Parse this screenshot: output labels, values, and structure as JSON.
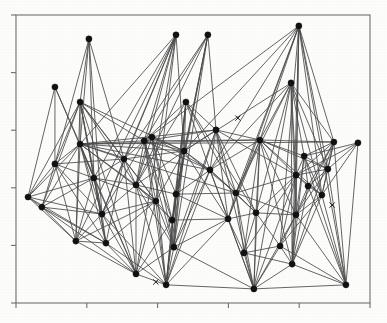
{
  "figure": {
    "title": "",
    "background_color": "#fdfdfc",
    "frame_color": "#6f6f6f",
    "node_color": "#121212",
    "edge_color": "#4a4a4a",
    "marker_color": "#1a1a1a"
  },
  "axes": {
    "x_tick_count": 6,
    "y_tick_count": 6,
    "x_tick_labels": [
      "",
      "",
      "",
      "",
      "",
      ""
    ],
    "y_tick_labels": [
      "",
      "",
      "",
      "",
      "",
      ""
    ],
    "xlabel": "",
    "ylabel": "",
    "grid": "off"
  },
  "chart_data": {
    "type": "scatter",
    "title": "",
    "subtitle": "",
    "xlabel": "",
    "ylabel": "",
    "xlim": [
      0,
      100
    ],
    "ylim": [
      0,
      100
    ],
    "grid": false,
    "legend": "none",
    "x_ticks": [
      0,
      20,
      40,
      60,
      80,
      100
    ],
    "y_ticks": [
      0,
      20,
      40,
      60,
      80,
      100
    ],
    "node_count": 46,
    "edge_count": 160,
    "marker_count": 3,
    "nodes": [
      {
        "id": 0,
        "x": 20.6,
        "y": 91.7
      },
      {
        "id": 1,
        "x": 45.2,
        "y": 93.1
      },
      {
        "id": 2,
        "x": 54.2,
        "y": 93.1
      },
      {
        "id": 3,
        "x": 79.9,
        "y": 96.2
      },
      {
        "id": 4,
        "x": 11.0,
        "y": 75.0
      },
      {
        "id": 5,
        "x": 18.1,
        "y": 69.8
      },
      {
        "id": 6,
        "x": 48.0,
        "y": 69.8
      },
      {
        "id": 7,
        "x": 77.7,
        "y": 76.4
      },
      {
        "id": 8,
        "x": 18.1,
        "y": 55.2
      },
      {
        "id": 9,
        "x": 36.2,
        "y": 56.3
      },
      {
        "id": 10,
        "x": 38.4,
        "y": 57.6
      },
      {
        "id": 11,
        "x": 56.5,
        "y": 60.1
      },
      {
        "id": 12,
        "x": 68.9,
        "y": 56.6
      },
      {
        "id": 13,
        "x": 89.8,
        "y": 55.9
      },
      {
        "id": 14,
        "x": 96.6,
        "y": 55.6
      },
      {
        "id": 15,
        "x": 11.0,
        "y": 48.3
      },
      {
        "id": 16,
        "x": 30.5,
        "y": 50.0
      },
      {
        "id": 17,
        "x": 47.5,
        "y": 52.8
      },
      {
        "id": 18,
        "x": 81.4,
        "y": 51.0
      },
      {
        "id": 19,
        "x": 88.1,
        "y": 46.5
      },
      {
        "id": 20,
        "x": 3.4,
        "y": 36.8
      },
      {
        "id": 21,
        "x": 7.3,
        "y": 33.3
      },
      {
        "id": 22,
        "x": 22.0,
        "y": 43.4
      },
      {
        "id": 23,
        "x": 33.9,
        "y": 41.0
      },
      {
        "id": 24,
        "x": 54.8,
        "y": 46.2
      },
      {
        "id": 25,
        "x": 79.1,
        "y": 44.4
      },
      {
        "id": 26,
        "x": 82.5,
        "y": 40.6
      },
      {
        "id": 27,
        "x": 39.5,
        "y": 35.4
      },
      {
        "id": 28,
        "x": 45.2,
        "y": 37.8
      },
      {
        "id": 29,
        "x": 62.1,
        "y": 38.2
      },
      {
        "id": 30,
        "x": 86.4,
        "y": 37.5
      },
      {
        "id": 31,
        "x": 24.3,
        "y": 30.9
      },
      {
        "id": 32,
        "x": 44.1,
        "y": 28.8
      },
      {
        "id": 33,
        "x": 59.9,
        "y": 29.2
      },
      {
        "id": 34,
        "x": 67.8,
        "y": 31.3
      },
      {
        "id": 35,
        "x": 79.1,
        "y": 30.6
      },
      {
        "id": 36,
        "x": 16.9,
        "y": 21.5
      },
      {
        "id": 37,
        "x": 25.4,
        "y": 20.8
      },
      {
        "id": 38,
        "x": 44.6,
        "y": 19.4
      },
      {
        "id": 39,
        "x": 64.4,
        "y": 17.4
      },
      {
        "id": 40,
        "x": 74.6,
        "y": 19.8
      },
      {
        "id": 41,
        "x": 78.0,
        "y": 13.5
      },
      {
        "id": 42,
        "x": 33.9,
        "y": 10.1
      },
      {
        "id": 43,
        "x": 42.4,
        "y": 6.3
      },
      {
        "id": 44,
        "x": 67.2,
        "y": 4.9
      },
      {
        "id": 45,
        "x": 93.2,
        "y": 6.3
      }
    ],
    "markers": [
      {
        "id": "m0",
        "x": 62.7,
        "y": 64.2,
        "shape": "x"
      },
      {
        "id": "m1",
        "x": 89.3,
        "y": 34.0,
        "shape": "x"
      },
      {
        "id": "m2",
        "x": 39.5,
        "y": 7.3,
        "shape": "x"
      }
    ],
    "edges": [
      [
        0,
        5
      ],
      [
        0,
        8
      ],
      [
        0,
        15
      ],
      [
        0,
        22
      ],
      [
        0,
        16
      ],
      [
        0,
        31
      ],
      [
        1,
        8
      ],
      [
        1,
        16
      ],
      [
        1,
        22
      ],
      [
        1,
        27
      ],
      [
        1,
        36
      ],
      [
        1,
        31
      ],
      [
        1,
        9
      ],
      [
        1,
        23
      ],
      [
        1,
        42
      ],
      [
        1,
        17
      ],
      [
        2,
        9
      ],
      [
        2,
        16
      ],
      [
        2,
        23
      ],
      [
        2,
        28
      ],
      [
        2,
        32
      ],
      [
        2,
        38
      ],
      [
        2,
        11
      ],
      [
        2,
        17
      ],
      [
        3,
        9
      ],
      [
        3,
        12
      ],
      [
        3,
        17
      ],
      [
        3,
        24
      ],
      [
        3,
        29
      ],
      [
        3,
        33
      ],
      [
        3,
        13
      ],
      [
        3,
        19
      ],
      [
        3,
        25
      ],
      [
        3,
        35
      ],
      [
        3,
        40
      ],
      [
        3,
        45
      ],
      [
        3,
        30
      ],
      [
        3,
        41
      ],
      [
        4,
        8
      ],
      [
        4,
        15
      ],
      [
        4,
        20
      ],
      [
        4,
        22
      ],
      [
        5,
        8
      ],
      [
        5,
        16
      ],
      [
        5,
        22
      ],
      [
        5,
        9
      ],
      [
        5,
        23
      ],
      [
        5,
        31
      ],
      [
        5,
        37
      ],
      [
        5,
        15
      ],
      [
        5,
        20
      ],
      [
        5,
        21
      ],
      [
        5,
        36
      ],
      [
        5,
        42
      ],
      [
        5,
        17
      ],
      [
        5,
        27
      ],
      [
        6,
        9
      ],
      [
        6,
        17
      ],
      [
        6,
        23
      ],
      [
        6,
        28
      ],
      [
        6,
        11
      ],
      [
        6,
        24
      ],
      [
        6,
        32
      ],
      [
        6,
        38
      ],
      [
        6,
        43
      ],
      [
        6,
        34
      ],
      [
        6,
        29
      ],
      [
        7,
        12
      ],
      [
        7,
        18
      ],
      [
        7,
        25
      ],
      [
        7,
        29
      ],
      [
        7,
        34
      ],
      [
        7,
        13
      ],
      [
        7,
        19
      ],
      [
        7,
        30
      ],
      [
        7,
        35
      ],
      [
        7,
        41
      ],
      [
        7,
        44
      ],
      [
        7,
        24
      ],
      [
        7,
        17
      ],
      [
        8,
        15
      ],
      [
        8,
        16
      ],
      [
        8,
        20
      ],
      [
        8,
        21
      ],
      [
        8,
        22
      ],
      [
        8,
        9
      ],
      [
        8,
        23
      ],
      [
        8,
        31
      ],
      [
        8,
        27
      ],
      [
        8,
        36
      ],
      [
        8,
        37
      ],
      [
        8,
        42
      ],
      [
        8,
        17
      ],
      [
        8,
        11
      ],
      [
        8,
        24
      ],
      [
        8,
        29
      ],
      [
        8,
        13
      ],
      [
        8,
        12
      ],
      [
        9,
        16
      ],
      [
        9,
        17
      ],
      [
        9,
        23
      ],
      [
        9,
        27
      ],
      [
        9,
        31
      ],
      [
        9,
        11
      ],
      [
        9,
        24
      ],
      [
        9,
        32
      ],
      [
        9,
        38
      ],
      [
        9,
        43
      ],
      [
        9,
        12
      ],
      [
        10,
        17
      ],
      [
        10,
        23
      ],
      [
        10,
        28
      ],
      [
        10,
        32
      ],
      [
        10,
        38
      ],
      [
        10,
        43
      ],
      [
        10,
        24
      ],
      [
        11,
        17
      ],
      [
        11,
        24
      ],
      [
        11,
        29
      ],
      [
        11,
        33
      ],
      [
        11,
        38
      ],
      [
        11,
        43
      ],
      [
        11,
        12
      ],
      [
        11,
        34
      ],
      [
        11,
        44
      ],
      [
        11,
        25
      ],
      [
        12,
        18
      ],
      [
        12,
        24
      ],
      [
        12,
        25
      ],
      [
        12,
        29
      ],
      [
        12,
        33
      ],
      [
        12,
        34
      ],
      [
        12,
        13
      ],
      [
        12,
        19
      ],
      [
        12,
        30
      ],
      [
        12,
        35
      ],
      [
        12,
        39
      ],
      [
        12,
        44
      ],
      [
        12,
        41
      ],
      [
        13,
        19
      ],
      [
        13,
        25
      ],
      [
        13,
        30
      ],
      [
        13,
        35
      ],
      [
        13,
        18
      ],
      [
        13,
        26
      ],
      [
        13,
        41
      ],
      [
        13,
        45
      ],
      [
        14,
        19
      ],
      [
        14,
        25
      ],
      [
        14,
        30
      ],
      [
        14,
        18
      ],
      [
        14,
        45
      ],
      [
        15,
        20
      ],
      [
        15,
        21
      ],
      [
        15,
        22
      ],
      [
        15,
        31
      ],
      [
        15,
        36
      ],
      [
        15,
        16
      ],
      [
        15,
        37
      ],
      [
        16,
        22
      ],
      [
        16,
        23
      ],
      [
        16,
        31
      ],
      [
        16,
        27
      ],
      [
        16,
        37
      ],
      [
        16,
        42
      ],
      [
        16,
        17
      ],
      [
        17,
        23
      ],
      [
        17,
        24
      ],
      [
        17,
        27
      ],
      [
        17,
        28
      ],
      [
        17,
        32
      ],
      [
        17,
        38
      ],
      [
        17,
        43
      ],
      [
        17,
        29
      ],
      [
        17,
        33
      ],
      [
        18,
        25
      ],
      [
        18,
        26
      ],
      [
        18,
        30
      ],
      [
        18,
        35
      ],
      [
        18,
        19
      ],
      [
        18,
        41
      ],
      [
        18,
        45
      ],
      [
        19,
        25
      ],
      [
        19,
        26
      ],
      [
        19,
        30
      ],
      [
        19,
        35
      ],
      [
        19,
        45
      ],
      [
        20,
        21
      ],
      [
        20,
        22
      ],
      [
        20,
        31
      ],
      [
        20,
        36
      ],
      [
        20,
        37
      ],
      [
        21,
        22
      ],
      [
        21,
        31
      ],
      [
        21,
        36
      ],
      [
        21,
        37
      ],
      [
        21,
        42
      ],
      [
        22,
        23
      ],
      [
        22,
        27
      ],
      [
        22,
        31
      ],
      [
        22,
        36
      ],
      [
        22,
        37
      ],
      [
        22,
        42
      ],
      [
        23,
        27
      ],
      [
        23,
        28
      ],
      [
        23,
        31
      ],
      [
        23,
        32
      ],
      [
        23,
        38
      ],
      [
        23,
        42
      ],
      [
        23,
        43
      ],
      [
        24,
        28
      ],
      [
        24,
        29
      ],
      [
        24,
        33
      ],
      [
        24,
        38
      ],
      [
        24,
        43
      ],
      [
        24,
        34
      ],
      [
        24,
        44
      ],
      [
        25,
        26
      ],
      [
        25,
        29
      ],
      [
        25,
        30
      ],
      [
        25,
        34
      ],
      [
        25,
        35
      ],
      [
        25,
        39
      ],
      [
        25,
        40
      ],
      [
        25,
        44
      ],
      [
        25,
        41
      ],
      [
        26,
        30
      ],
      [
        26,
        35
      ],
      [
        26,
        41
      ],
      [
        26,
        45
      ],
      [
        27,
        31
      ],
      [
        27,
        32
      ],
      [
        27,
        36
      ],
      [
        27,
        37
      ],
      [
        27,
        42
      ],
      [
        27,
        43
      ],
      [
        27,
        38
      ],
      [
        28,
        32
      ],
      [
        28,
        33
      ],
      [
        28,
        38
      ],
      [
        28,
        43
      ],
      [
        28,
        29
      ],
      [
        29,
        33
      ],
      [
        29,
        34
      ],
      [
        29,
        39
      ],
      [
        29,
        44
      ],
      [
        29,
        35
      ],
      [
        30,
        35
      ],
      [
        30,
        40
      ],
      [
        30,
        41
      ],
      [
        30,
        45
      ],
      [
        31,
        36
      ],
      [
        31,
        37
      ],
      [
        31,
        42
      ],
      [
        31,
        43
      ],
      [
        32,
        38
      ],
      [
        32,
        42
      ],
      [
        32,
        43
      ],
      [
        32,
        33
      ],
      [
        33,
        38
      ],
      [
        33,
        39
      ],
      [
        33,
        43
      ],
      [
        33,
        44
      ],
      [
        33,
        34
      ],
      [
        34,
        39
      ],
      [
        34,
        40
      ],
      [
        34,
        44
      ],
      [
        34,
        35
      ],
      [
        35,
        40
      ],
      [
        35,
        41
      ],
      [
        35,
        44
      ],
      [
        35,
        45
      ],
      [
        36,
        37
      ],
      [
        36,
        42
      ],
      [
        37,
        42
      ],
      [
        37,
        43
      ],
      [
        38,
        42
      ],
      [
        38,
        43
      ],
      [
        38,
        44
      ],
      [
        39,
        40
      ],
      [
        39,
        44
      ],
      [
        39,
        41
      ],
      [
        40,
        41
      ],
      [
        40,
        45
      ],
      [
        40,
        44
      ],
      [
        41,
        45
      ],
      [
        41,
        44
      ],
      [
        42,
        43
      ],
      [
        43,
        44
      ],
      [
        44,
        45
      ]
    ]
  }
}
